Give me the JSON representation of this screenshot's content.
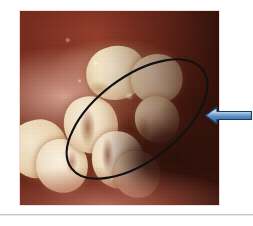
{
  "slide": {
    "background_color": "#ffffff",
    "width": 253,
    "height": 226
  },
  "photo": {
    "alt": "Clinical intraoral photograph of posterior maxillary quadrant showing erupting molar teeth with brown occlusal staining and inflamed gingival tissue",
    "frame_border_color": "#f2dcd8",
    "region_colors": {
      "mucosa": "#7e2d1e",
      "gingiva": "#e0aa98",
      "enamel": "#f6e9d2",
      "stain": "#84421 8",
      "cavity_shadow": "#120603"
    },
    "features": [
      {
        "name": "upper-mucosa",
        "label": "Buccal mucosa"
      },
      {
        "name": "attached-gingiva",
        "label": "Attached gingiva"
      },
      {
        "name": "molar-teeth",
        "label": "Posterior teeth"
      },
      {
        "name": "oral-cavity-shadow",
        "label": "Oral cavity shadow"
      }
    ]
  },
  "annotations": {
    "ellipse": {
      "label": "Region of interest",
      "stroke_color": "#111111",
      "stroke_width": 2.1,
      "rotation_deg": -37,
      "center_x": 137,
      "center_y": 119,
      "radius_x": 82,
      "radius_y": 42
    },
    "arrow": {
      "label": "Pointer arrow",
      "direction": "left",
      "fill_color_light": "#9dc3e6",
      "fill_color_dark": "#2e5f96",
      "outline_color": "#1b3c63"
    }
  },
  "divider": {
    "label": "Slide footer rule",
    "color": "#c8c8c8"
  }
}
